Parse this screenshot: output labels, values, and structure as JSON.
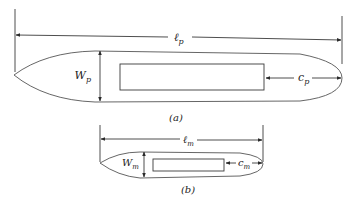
{
  "figure_a": {
    "caption": "(a)",
    "length_label": "ℓ",
    "length_sub": "p",
    "width_label": "W",
    "width_sub": "p",
    "clearance_label": "c",
    "clearance_sub": "p"
  },
  "figure_b": {
    "caption": "(b)",
    "length_label": "ℓ",
    "length_sub": "m",
    "width_label": "W",
    "width_sub": "m",
    "clearance_label": "c",
    "clearance_sub": "m"
  },
  "colors": {
    "stroke": "#3a3a3a",
    "background": "#ffffff"
  }
}
